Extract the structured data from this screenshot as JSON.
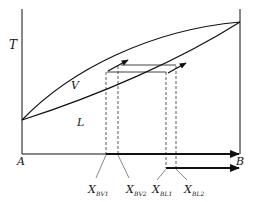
{
  "diagram": {
    "type": "binary phase diagram (T vs composition)",
    "axis": {
      "y_label": "T",
      "x_left_label": "A",
      "x_right_label": "B"
    },
    "curves": [
      {
        "name": "vapor",
        "label": "V"
      },
      {
        "name": "liquid",
        "label": "L"
      }
    ],
    "compositions": [
      {
        "main": "X",
        "sub": "BV1"
      },
      {
        "main": "X",
        "sub": "BV2"
      },
      {
        "main": "X",
        "sub": "BL1"
      },
      {
        "main": "X",
        "sub": "BL2"
      }
    ],
    "colors": {
      "line": "#111111",
      "background": "#ffffff"
    }
  }
}
